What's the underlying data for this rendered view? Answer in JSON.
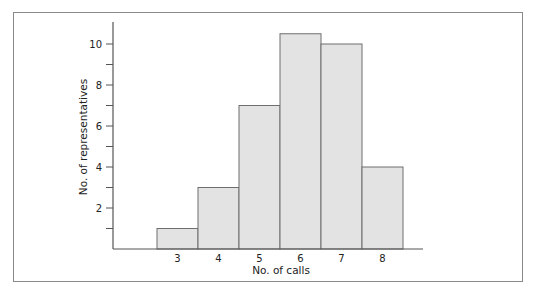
{
  "chart_data": {
    "type": "bar",
    "subtype": "histogram",
    "title": "",
    "xlabel": "No. of calls",
    "ylabel": "No. of representatives",
    "categories": [
      "3",
      "4",
      "5",
      "6",
      "7",
      "8"
    ],
    "values": [
      1,
      3,
      7,
      10.5,
      10,
      4
    ],
    "y_tick_labels": [
      "2",
      "4",
      "6",
      "8",
      "10"
    ],
    "y_ticks_minor_every": 1,
    "ylim": [
      0,
      11
    ],
    "grid": false,
    "legend": null,
    "colors": {
      "bar_fill": "#e3e3e3",
      "bar_stroke": "#6e6e6e",
      "axis": "#555555",
      "frame": "#8a8a8a"
    }
  }
}
